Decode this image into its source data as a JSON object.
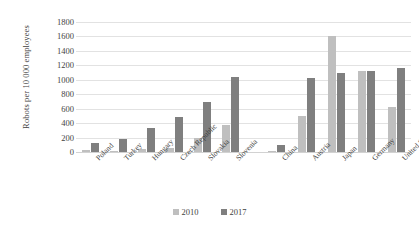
{
  "chart_data": {
    "type": "bar",
    "title": "",
    "xlabel": "",
    "ylabel": "Robots per 10 000 employees",
    "ylim": [
      0,
      1800
    ],
    "ytick_step": 200,
    "yticks": [
      1800,
      1600,
      1400,
      1200,
      1000,
      800,
      600,
      400,
      200,
      0
    ],
    "grid": true,
    "legend_position": "bottom-center",
    "orientation": "vertical",
    "grouped": true,
    "panels": [
      {
        "name": "panel-left",
        "categories": [
          "Poland",
          "Turkey",
          "Hungary",
          "Czech Republic",
          "Slovakia",
          "Slovenia"
        ],
        "series": [
          {
            "name": "2010",
            "color": "#bfbfbf",
            "values": [
              30,
              10,
              40,
              60,
              200,
              380
            ]
          },
          {
            "name": "2017",
            "color": "#7f7f7f",
            "values": [
              130,
              180,
              330,
              480,
              690,
              1040
            ]
          }
        ]
      },
      {
        "name": "panel-right",
        "categories": [
          "China",
          "Austria",
          "Japan",
          "Germany",
          "United States"
        ],
        "series": [
          {
            "name": "2010",
            "color": "#bfbfbf",
            "values": [
              20,
              500,
              1600,
              1120,
              620
            ]
          },
          {
            "name": "2017",
            "color": "#7f7f7f",
            "values": [
              100,
              1020,
              1100,
              1120,
              1170
            ]
          }
        ]
      }
    ],
    "legend": [
      {
        "label": "2010",
        "color": "#bfbfbf"
      },
      {
        "label": "2017",
        "color": "#7f7f7f"
      }
    ]
  }
}
